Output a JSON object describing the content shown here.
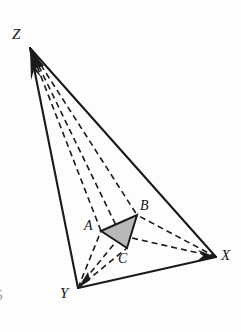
{
  "figure": {
    "type": "geometry-diagram",
    "background_color": "#fdfdfd",
    "stroke_color": "#1a1a1a",
    "shaded_fill_color": "#b8b8b8",
    "canvas": {
      "width": 241,
      "height": 332
    }
  },
  "points": {
    "Z": {
      "label": "Z",
      "x": 30,
      "y": 48,
      "label_x": 12,
      "label_y": 27
    },
    "X": {
      "label": "X",
      "x": 216,
      "y": 257,
      "label_x": 221,
      "label_y": 249
    },
    "Y": {
      "label": "Y",
      "x": 78,
      "y": 288,
      "label_x": 61,
      "label_y": 287
    },
    "A": {
      "label": "A",
      "x": 101,
      "y": 231,
      "label_x": 85,
      "label_y": 220
    },
    "B": {
      "label": "B",
      "x": 137,
      "y": 215,
      "label_x": 141,
      "label_y": 200
    },
    "C": {
      "label": "C",
      "x": 127,
      "y": 248,
      "label_x": 119,
      "label_y": 253
    }
  },
  "solid_edges": [
    {
      "name": "edge-Z-Y",
      "from": "Z",
      "to": "Y"
    },
    {
      "name": "edge-Z-X",
      "from": "Z",
      "to": "X"
    },
    {
      "name": "edge-Y-X",
      "from": "Y",
      "to": "X"
    }
  ],
  "dashed_edges": [
    {
      "name": "edge-Z-A",
      "from": "Z",
      "to": "A"
    },
    {
      "name": "edge-Z-B",
      "from": "Z",
      "to": "B"
    },
    {
      "name": "edge-Z-C",
      "from": "Z",
      "to": "C"
    },
    {
      "name": "edge-X-B",
      "from": "X",
      "to": "B"
    },
    {
      "name": "edge-X-A",
      "from": "X",
      "to": "A"
    },
    {
      "name": "edge-Y-A",
      "from": "Y",
      "to": "A"
    },
    {
      "name": "edge-Y-C",
      "from": "Y",
      "to": "C"
    },
    {
      "name": "edge-Y-B",
      "from": "Y",
      "to": "B"
    }
  ],
  "shaded_triangle": {
    "name": "triangle-ABC",
    "vertices": [
      "A",
      "B",
      "C"
    ],
    "fill": "#b8b8b8"
  },
  "arrowheads": [
    {
      "name": "arrowhead-Z",
      "at": "Z"
    },
    {
      "name": "arrowhead-X",
      "at": "X"
    },
    {
      "name": "arrowhead-Y",
      "at": "Y"
    }
  ],
  "page_number_fragment": "6"
}
